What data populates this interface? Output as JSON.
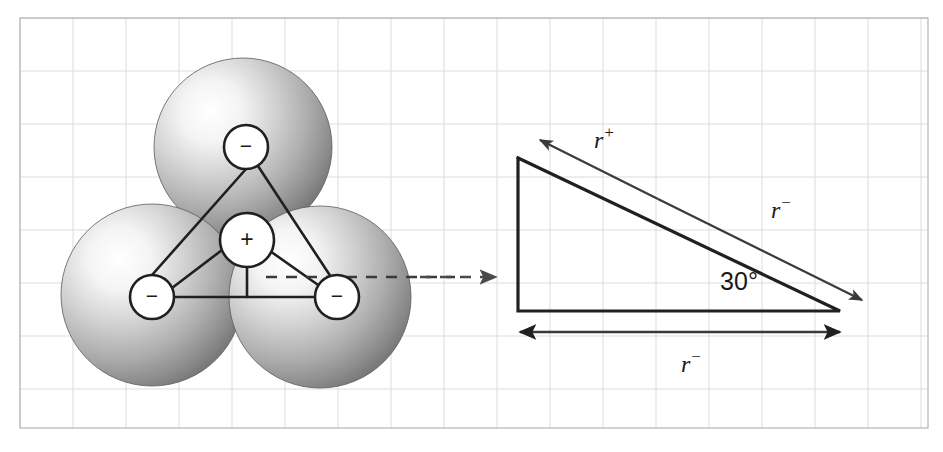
{
  "figure": {
    "background_color": "#ffffff",
    "grid": {
      "visible": true,
      "line_color": "#dcdcdc",
      "border_color": "#b4b4b4",
      "cell_size": 53,
      "left": 20,
      "top": 18,
      "right": 928,
      "bottom": 428
    },
    "ink_color": "#231f20",
    "sphere": {
      "fill_light": "#ffffff",
      "fill_mid": "#c8c8c8",
      "fill_dark": "#6e6e6e",
      "edge_color": "#5a5a5a"
    }
  },
  "left_panel": {
    "name": "sphere-packing-diagram",
    "spheres": [
      {
        "id": "anion-top",
        "cx": 243,
        "cy": 147,
        "r": 89
      },
      {
        "id": "anion-left",
        "cx": 152,
        "cy": 295,
        "r": 91
      },
      {
        "id": "anion-right",
        "cx": 320,
        "cy": 297,
        "r": 91
      }
    ],
    "charges": [
      {
        "id": "charge-anion-top",
        "label": "−",
        "cx": 246,
        "cy": 147,
        "r": 22
      },
      {
        "id": "charge-anion-left",
        "label": "−",
        "cx": 152,
        "cy": 297,
        "r": 22
      },
      {
        "id": "charge-anion-right",
        "label": "−",
        "cx": 337,
        "cy": 297,
        "r": 22
      },
      {
        "id": "charge-cation-center",
        "label": "+",
        "cx": 247,
        "cy": 240,
        "r": 27
      }
    ],
    "connector_lines": [
      {
        "id": "bond-top-left",
        "x1": 246,
        "y1": 169,
        "x2": 152,
        "y2": 275
      },
      {
        "id": "bond-top-right",
        "x1": 258,
        "y1": 166,
        "x2": 331,
        "y2": 277
      },
      {
        "id": "bond-left-right",
        "x1": 174,
        "y1": 297,
        "x2": 315,
        "y2": 297
      },
      {
        "id": "bond-center-left",
        "x1": 222,
        "y1": 250,
        "x2": 172,
        "y2": 288
      },
      {
        "id": "bond-center-right",
        "x1": 270,
        "y1": 251,
        "x2": 321,
        "y2": 287
      },
      {
        "id": "bond-center-down",
        "x1": 247,
        "y1": 267,
        "x2": 247,
        "y2": 297
      }
    ],
    "dashed_axis": {
      "id": "reference-axis",
      "x1": 266,
      "y1": 277,
      "x2": 455,
      "y2": 277
    },
    "pointer_arrow": {
      "id": "expand-pointer",
      "x1": 420,
      "y1": 277,
      "x2": 496,
      "y2": 277
    }
  },
  "right_panel": {
    "name": "geometry-triangle-diagram",
    "triangle": {
      "apex_top_left": {
        "x": 518,
        "y": 158
      },
      "corner_bottom_left": {
        "x": 518,
        "y": 311
      },
      "corner_bottom_right": {
        "x": 840,
        "y": 311
      }
    },
    "angle": {
      "id": "interior-angle",
      "value": "30°",
      "x": 739,
      "y": 290
    },
    "vector_arrow": {
      "id": "radius-sum-arrow",
      "start": {
        "x": 540,
        "y": 140
      },
      "mid": {
        "x": 658,
        "y": 199
      },
      "end": {
        "x": 862,
        "y": 300
      },
      "double_headed": true
    },
    "labels": [
      {
        "id": "label-r-plus",
        "base": "r",
        "sup": "+",
        "x": 594,
        "y": 148
      },
      {
        "id": "label-r-minus-upper",
        "base": "r",
        "sup": "−",
        "x": 771,
        "y": 218
      },
      {
        "id": "label-r-minus-lower",
        "base": "r",
        "sup": "−",
        "x": 681,
        "y": 372
      }
    ],
    "base_measure": {
      "id": "base-length-arrow",
      "x1": 520,
      "x2": 840,
      "y": 332,
      "double_headed": true
    }
  }
}
